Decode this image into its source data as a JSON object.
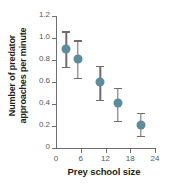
{
  "chart_data": {
    "type": "scatter",
    "title": "",
    "xlabel": "Prey school size",
    "ylabel_lines": [
      "Number of predator",
      "approaches per minute"
    ],
    "ylabel": "Number of predator approaches per minute",
    "xlim": [
      0,
      24
    ],
    "ylim": [
      0,
      1.2
    ],
    "xticks": [
      0,
      6,
      12,
      18,
      24
    ],
    "xtick_labels": [
      "0",
      "6",
      "12",
      "18",
      "24"
    ],
    "yticks": [
      0,
      0.2,
      0.4,
      0.6,
      0.8,
      1.0,
      1.2
    ],
    "ytick_labels": [
      "0",
      "0.2",
      "0.4",
      "0.6",
      "0.8",
      "1.0",
      "1.2"
    ],
    "grid": false,
    "legend": "none",
    "marker_color": "#5d8c9c",
    "errorbar_color": "#6d6e71",
    "axis_color": "#6d6e71",
    "background": "#ffffff",
    "points": [
      {
        "x": 2.5,
        "y": 0.9,
        "ylow": 0.74,
        "yhigh": 1.06
      },
      {
        "x": 5.3,
        "y": 0.81,
        "ylow": 0.64,
        "yhigh": 0.98
      },
      {
        "x": 10.7,
        "y": 0.6,
        "ylow": 0.44,
        "yhigh": 0.75
      },
      {
        "x": 15.0,
        "y": 0.41,
        "ylow": 0.25,
        "yhigh": 0.55
      },
      {
        "x": 20.5,
        "y": 0.21,
        "ylow": 0.11,
        "yhigh": 0.32
      }
    ]
  }
}
